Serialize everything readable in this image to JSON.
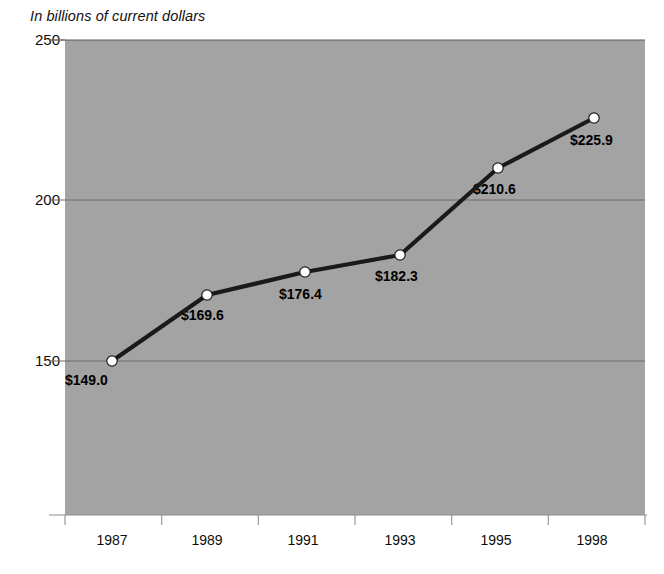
{
  "chart_data": {
    "type": "line",
    "title": "In billions of current dollars",
    "xlabel": "",
    "ylabel": "",
    "categories": [
      "1987",
      "1989",
      "1991",
      "1993",
      "1995",
      "1998"
    ],
    "values": [
      149.0,
      169.6,
      176.4,
      182.3,
      210.6,
      225.9
    ],
    "point_labels": [
      "$149.0",
      "$169.6",
      "$176.4",
      "$182.3",
      "$210.6",
      "$225.9"
    ],
    "series": [
      {
        "name": "In billions of current dollars",
        "values": [
          149.0,
          169.6,
          176.4,
          182.3,
          210.6,
          225.9
        ]
      }
    ],
    "ylim": [
      108,
      250
    ],
    "yticks": [
      150,
      200,
      250
    ],
    "ytick_labels": [
      "150",
      "200",
      "250"
    ],
    "xtick_labels": [
      "1987",
      "1989",
      "1991",
      "1993",
      "1995",
      "1998"
    ],
    "grid": true,
    "legend": false,
    "plot_background": "#a3a3a3",
    "line_color": "#1a1a1a",
    "marker_fill": "#ffffff",
    "marker_edge": "#1a1a1a",
    "gridline_color": "#6d6d6d",
    "axis_color": "#8a8a8a",
    "text_color": "#0d0d0d"
  },
  "axes": {
    "y": {
      "ticks": [
        {
          "label": "250",
          "y": 40
        },
        {
          "label": "200",
          "y": 200
        },
        {
          "label": "150",
          "y": 361
        }
      ]
    },
    "x": {
      "ticks": [
        {
          "label": "1987",
          "x": 112
        },
        {
          "label": "1989",
          "x": 207
        },
        {
          "label": "1991",
          "x": 303
        },
        {
          "label": "1993",
          "x": 400
        },
        {
          "label": "1995",
          "x": 496
        },
        {
          "label": "1998",
          "x": 592
        }
      ]
    }
  },
  "points": [
    {
      "label": "$149.0",
      "x": 112,
      "y": 361,
      "lx": 65,
      "ly": 372
    },
    {
      "label": "$169.6",
      "x": 207,
      "y": 295,
      "lx": 181,
      "ly": 307
    },
    {
      "label": "$176.4",
      "x": 305,
      "y": 272,
      "lx": 279,
      "ly": 286
    },
    {
      "label": "$182.3",
      "x": 400,
      "y": 255,
      "lx": 375,
      "ly": 268
    },
    {
      "label": "$210.6",
      "x": 498,
      "y": 168,
      "lx": 473,
      "ly": 181
    },
    {
      "label": "$225.9",
      "x": 594,
      "y": 118,
      "lx": 570,
      "ly": 132
    }
  ]
}
